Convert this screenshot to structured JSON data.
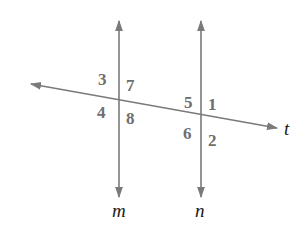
{
  "diagram": {
    "colors": {
      "line": "#7a7a7a",
      "angle_number": "#6e6e6e",
      "line_label": "#1a1a1a",
      "background": "#ffffff"
    },
    "lines": [
      {
        "id": "m",
        "label": "m",
        "x1": 119,
        "y1": 20,
        "x2": 119,
        "y2": 198
      },
      {
        "id": "n",
        "label": "n",
        "x1": 201,
        "y1": 20,
        "x2": 201,
        "y2": 198
      },
      {
        "id": "t",
        "label": "t",
        "x1": 30,
        "y1": 84,
        "x2": 278,
        "y2": 128
      }
    ],
    "angles": [
      {
        "number": "3",
        "at_line": "m",
        "position": "upper-left"
      },
      {
        "number": "7",
        "at_line": "m",
        "position": "upper-right"
      },
      {
        "number": "4",
        "at_line": "m",
        "position": "lower-left"
      },
      {
        "number": "8",
        "at_line": "m",
        "position": "lower-right"
      },
      {
        "number": "5",
        "at_line": "n",
        "position": "upper-left"
      },
      {
        "number": "1",
        "at_line": "n",
        "position": "upper-right"
      },
      {
        "number": "6",
        "at_line": "n",
        "position": "lower-left"
      },
      {
        "number": "2",
        "at_line": "n",
        "position": "lower-right"
      }
    ]
  }
}
